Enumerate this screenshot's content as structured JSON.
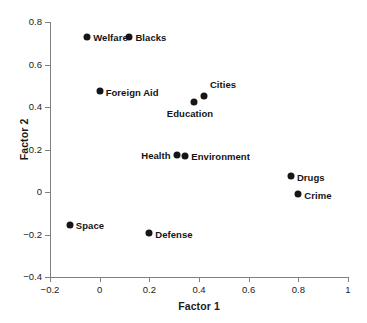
{
  "chart_data": {
    "type": "scatter",
    "title": "",
    "xlabel": "Factor 1",
    "ylabel": "Factor 2",
    "xlim": [
      -0.2,
      1.0
    ],
    "ylim": [
      -0.4,
      0.8
    ],
    "xticks": [
      "-0.2",
      "0",
      "0.2",
      "0.4",
      "0.6",
      "0.8",
      "1"
    ],
    "xtick_values": [
      -0.2,
      0,
      0.2,
      0.4,
      0.6,
      0.8,
      1
    ],
    "yticks": [
      "0.8",
      "0.6",
      "0.4",
      "0.2",
      "0",
      "-0.2",
      "-0.4"
    ],
    "ytick_values": [
      0.8,
      0.6,
      0.4,
      0.2,
      0,
      -0.2,
      -0.4
    ],
    "grid": false,
    "legend": "none",
    "marker_color": "#161616",
    "axis_color": "#808080",
    "points": [
      {
        "label": "Welfare",
        "x": -0.05,
        "y": 0.73,
        "label_pos": "right"
      },
      {
        "label": "Blacks",
        "x": 0.12,
        "y": 0.73,
        "label_pos": "right"
      },
      {
        "label": "Foreign Aid",
        "x": 0.0,
        "y": 0.475,
        "label_pos": "right"
      },
      {
        "label": "Cities",
        "x": 0.42,
        "y": 0.45,
        "label_pos": "above"
      },
      {
        "label": "Education",
        "x": 0.38,
        "y": 0.425,
        "label_pos": "below"
      },
      {
        "label": "Health",
        "x": 0.31,
        "y": 0.175,
        "label_pos": "left"
      },
      {
        "label": "Environment",
        "x": 0.345,
        "y": 0.17,
        "label_pos": "right"
      },
      {
        "label": "Drugs",
        "x": 0.77,
        "y": 0.075,
        "label_pos": "right"
      },
      {
        "label": "Crime",
        "x": 0.8,
        "y": -0.01,
        "label_pos": "right"
      },
      {
        "label": "Space",
        "x": -0.12,
        "y": -0.155,
        "label_pos": "right"
      },
      {
        "label": "Defense",
        "x": 0.2,
        "y": -0.195,
        "label_pos": "right"
      }
    ]
  }
}
